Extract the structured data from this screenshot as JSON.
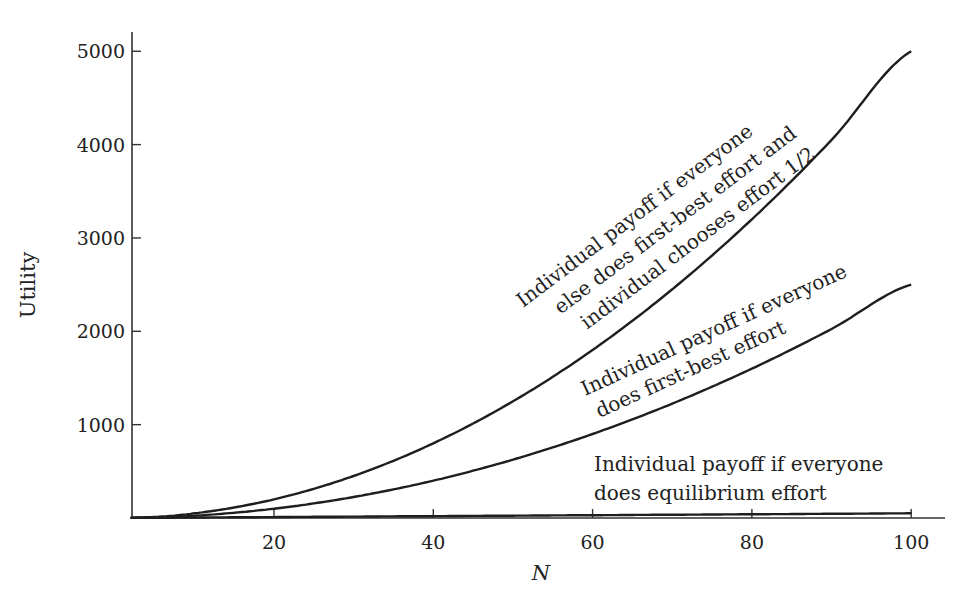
{
  "chart_data": {
    "type": "line",
    "title": "",
    "xlabel": "N",
    "ylabel": "Utility",
    "xlim": [
      2,
      106
    ],
    "ylim": [
      0,
      5200
    ],
    "grid": false,
    "legend": "none (curves labeled inline)",
    "x_ticks": [
      20,
      40,
      60,
      80,
      100
    ],
    "y_ticks": [
      1000,
      2000,
      3000,
      4000,
      5000
    ],
    "x": [
      2,
      10,
      20,
      30,
      40,
      50,
      60,
      70,
      80,
      90,
      100
    ],
    "series": [
      {
        "name": "Individual payoff if everyone else does first-best effort and individual chooses effort 1/2",
        "values": [
          2,
          50,
          200,
          450,
          800,
          1250,
          1800,
          2450,
          3200,
          4050,
          5000
        ]
      },
      {
        "name": "Individual payoff if everyone does first-best effort",
        "values": [
          1,
          25,
          100,
          225,
          400,
          625,
          900,
          1225,
          1600,
          2025,
          2500
        ]
      },
      {
        "name": "Individual payoff if everyone does equilibrium effort",
        "values": [
          1,
          5,
          10,
          15,
          20,
          25,
          30,
          35,
          40,
          45,
          50
        ]
      }
    ],
    "annotations": [
      {
        "lines": [
          "Individual payoff if everyone",
          "else does first-best effort and",
          "individual chooses effort 1/2"
        ],
        "series": 0
      },
      {
        "lines": [
          "Individual payoff if everyone",
          "does first-best effort"
        ],
        "series": 1
      },
      {
        "lines": [
          "Individual payoff if everyone",
          "does equilibrium effort"
        ],
        "series": 2
      }
    ]
  },
  "style": {
    "curve_color": "#1e1e1e",
    "axis_color": "#333333",
    "text_color": "#222222",
    "background": "#ffffff"
  }
}
